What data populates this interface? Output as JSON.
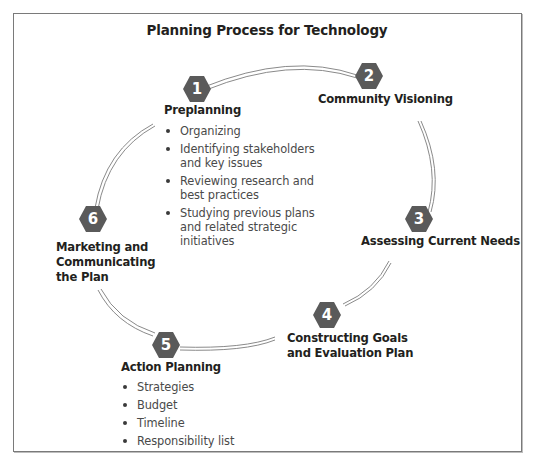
{
  "diagram": {
    "title": "Planning Process for Technology",
    "type": "cycle",
    "colors": {
      "hexagon_fill": "#5a5a5a",
      "hexagon_text": "#ffffff",
      "arc": "#8a8a8a",
      "frame": "#7a7a7a"
    },
    "steps": [
      {
        "number": "1",
        "label": "Preplanning",
        "bullets": [
          "Organizing",
          "Identifying stakeholders and key issues",
          "Reviewing research and best practices",
          "Studying previous plans and related strategic initiatives"
        ]
      },
      {
        "number": "2",
        "label": "Community Visioning",
        "bullets": []
      },
      {
        "number": "3",
        "label": "Assessing Current Needs",
        "bullets": []
      },
      {
        "number": "4",
        "label_lines": [
          "Constructing Goals",
          "and Evaluation Plan"
        ],
        "bullets": []
      },
      {
        "number": "5",
        "label": "Action Planning",
        "bullets": [
          "Strategies",
          "Budget",
          "Timeline",
          "Responsibility list"
        ]
      },
      {
        "number": "6",
        "label_lines": [
          "Marketing and",
          "Communicating",
          "the Plan"
        ],
        "bullets": []
      }
    ]
  }
}
